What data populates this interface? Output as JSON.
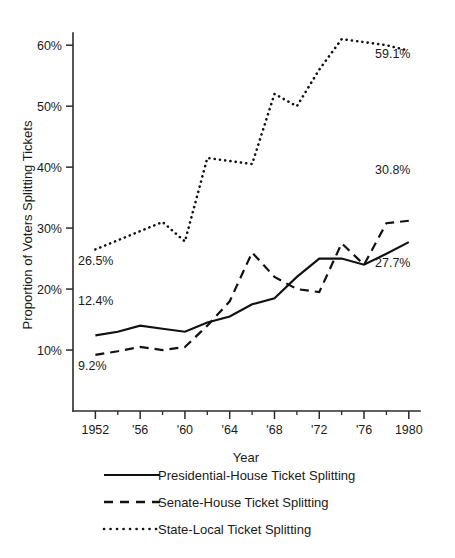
{
  "chart_data": {
    "type": "line",
    "title": "",
    "xlabel": "Year",
    "ylabel": "Proportion of Voters Splitting Tickets",
    "xlim": [
      1950,
      1981
    ],
    "ylim": [
      0,
      62
    ],
    "grid": false,
    "legend_position": "below-plot",
    "x_tick_values": [
      1952,
      1954,
      1956,
      1958,
      1960,
      1962,
      1964,
      1966,
      1968,
      1970,
      1972,
      1974,
      1976,
      1978,
      1980
    ],
    "x_tick_labels": [
      "1952",
      "",
      "'56",
      "",
      "'60",
      "",
      "'64",
      "",
      "'68",
      "",
      "'72",
      "",
      "'76",
      "",
      "1980"
    ],
    "y_tick_values": [
      10,
      20,
      30,
      40,
      50,
      60
    ],
    "y_tick_labels": [
      "10%",
      "20%",
      "30%",
      "40%",
      "50%",
      "60%"
    ],
    "x": [
      1952,
      1954,
      1956,
      1958,
      1960,
      1962,
      1964,
      1966,
      1968,
      1970,
      1972,
      1974,
      1976,
      1978,
      1980
    ],
    "series": [
      {
        "name": "Presidential-House Ticket Splitting",
        "style": "solid",
        "values": [
          12.4,
          13.0,
          14.0,
          13.5,
          13.0,
          14.5,
          15.5,
          17.5,
          18.5,
          22.0,
          25.0,
          25.0,
          24.0,
          25.8,
          27.7
        ]
      },
      {
        "name": "Senate-House Ticket Splitting",
        "style": "dashed",
        "values": [
          9.2,
          9.8,
          10.5,
          10.0,
          10.5,
          14.0,
          18.0,
          26.0,
          22.0,
          20.0,
          19.5,
          27.5,
          24.0,
          30.8,
          31.2
        ]
      },
      {
        "name": "State-Local Ticket Splitting",
        "style": "dotted",
        "values": [
          26.5,
          28.0,
          29.5,
          31.0,
          27.8,
          41.5,
          41.0,
          40.5,
          52.0,
          50.0,
          56.0,
          61.0,
          60.5,
          60.0,
          59.1
        ]
      }
    ],
    "annotations": [
      {
        "text": "59.1%",
        "x_px": 375,
        "y_px": 58
      },
      {
        "text": "30.8%",
        "x_px": 375,
        "y_px": 174
      },
      {
        "text": "27.7%",
        "x_px": 375,
        "y_px": 267
      },
      {
        "text": "26.5%",
        "x_px": 78,
        "y_px": 265
      },
      {
        "text": "12.4%",
        "x_px": 78,
        "y_px": 305
      },
      {
        "text": "9.2%",
        "x_px": 78,
        "y_px": 370
      }
    ]
  },
  "legend": {
    "items": [
      {
        "label": "Presidential-House Ticket Splitting",
        "style": "solid"
      },
      {
        "label": "Senate-House Ticket Splitting",
        "style": "dashed"
      },
      {
        "label": "State-Local Ticket Splitting",
        "style": "dotted"
      }
    ]
  },
  "colors": {
    "ink": "#111111",
    "axis": "#2b2b2b",
    "background": "#ffffff"
  }
}
